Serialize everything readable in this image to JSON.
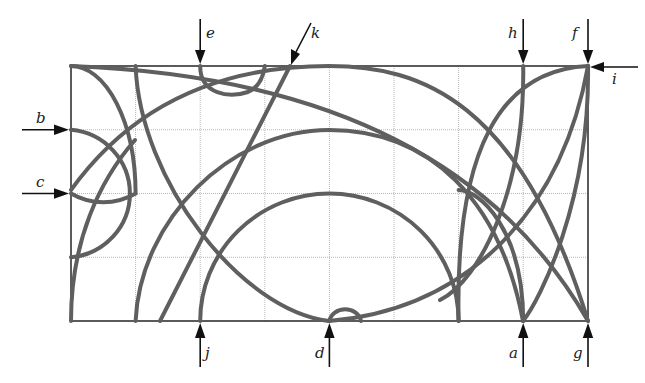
{
  "figure": {
    "grid": {
      "x0": 71,
      "y0": 66,
      "cols": 8,
      "rows": 4,
      "cell_w": 64.6,
      "cell_h": 63.75
    },
    "curve_color": "#5f5f5f",
    "labels": {
      "a": "a",
      "b": "b",
      "c": "c",
      "d": "d",
      "e": "e",
      "f": "f",
      "g": "g",
      "h": "h",
      "i": "i",
      "j": "j",
      "k": "k"
    },
    "arrows": [
      {
        "id": "e",
        "direction": "down",
        "column": 2
      },
      {
        "id": "k",
        "direction": "down-left",
        "column": 3.5
      },
      {
        "id": "h",
        "direction": "down",
        "column": 7
      },
      {
        "id": "f",
        "direction": "down",
        "column": 8
      },
      {
        "id": "i",
        "direction": "left",
        "row": 0
      },
      {
        "id": "b",
        "direction": "right",
        "row": 1
      },
      {
        "id": "c",
        "direction": "right",
        "row": 2
      },
      {
        "id": "j",
        "direction": "up",
        "column": 2
      },
      {
        "id": "d",
        "direction": "up",
        "column": 4
      },
      {
        "id": "a",
        "direction": "up",
        "column": 7
      },
      {
        "id": "g",
        "direction": "up",
        "column": 8
      }
    ]
  }
}
